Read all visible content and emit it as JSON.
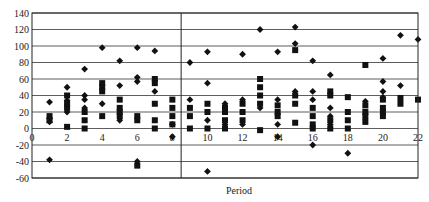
{
  "chart_data": {
    "type": "scatter",
    "title": "",
    "xlabel": "Period",
    "ylabel": "",
    "xlim": [
      0,
      22
    ],
    "ylim": [
      -60,
      140
    ],
    "x_ticks": [
      0,
      2,
      4,
      6,
      8,
      10,
      12,
      14,
      16,
      18,
      20,
      22
    ],
    "y_ticks": [
      -60,
      -40,
      -20,
      0,
      20,
      40,
      60,
      80,
      100,
      120,
      140
    ],
    "grid": {
      "horizontal": true,
      "vertical": false
    },
    "reference_line_x": 8.5,
    "legend": null,
    "series": [
      {
        "name": "diamond",
        "marker": "diamond",
        "points": [
          [
            1,
            32
          ],
          [
            1,
            12
          ],
          [
            1,
            8
          ],
          [
            1,
            -38
          ],
          [
            2,
            50
          ],
          [
            2,
            34
          ],
          [
            2,
            20
          ],
          [
            3,
            72
          ],
          [
            3,
            40
          ],
          [
            3,
            35
          ],
          [
            3,
            25
          ],
          [
            4,
            98
          ],
          [
            4,
            30
          ],
          [
            5,
            82
          ],
          [
            5,
            52
          ],
          [
            5,
            10
          ],
          [
            6,
            98
          ],
          [
            6,
            62
          ],
          [
            6,
            57
          ],
          [
            6,
            -40
          ],
          [
            7,
            94
          ],
          [
            7,
            45
          ],
          [
            8,
            5
          ],
          [
            8,
            -10
          ],
          [
            9,
            80
          ],
          [
            9,
            35
          ],
          [
            10,
            93
          ],
          [
            10,
            55
          ],
          [
            10,
            10
          ],
          [
            10,
            -52
          ],
          [
            11,
            30
          ],
          [
            11,
            5
          ],
          [
            12,
            90
          ],
          [
            12,
            35
          ],
          [
            12,
            5
          ],
          [
            13,
            120
          ],
          [
            13,
            25
          ],
          [
            14,
            93
          ],
          [
            14,
            35
          ],
          [
            14,
            5
          ],
          [
            14,
            -10
          ],
          [
            15,
            123
          ],
          [
            15,
            103
          ],
          [
            15,
            45
          ],
          [
            16,
            82
          ],
          [
            16,
            45
          ],
          [
            16,
            35
          ],
          [
            16,
            -20
          ],
          [
            17,
            65
          ],
          [
            17,
            25
          ],
          [
            17,
            15
          ],
          [
            17,
            5
          ],
          [
            18,
            -30
          ],
          [
            19,
            33
          ],
          [
            20,
            85
          ],
          [
            20,
            57
          ],
          [
            20,
            45
          ],
          [
            20,
            38
          ],
          [
            21,
            113
          ],
          [
            21,
            52
          ],
          [
            22,
            108
          ]
        ]
      },
      {
        "name": "square",
        "marker": "square",
        "points": [
          [
            1,
            15
          ],
          [
            1,
            10
          ],
          [
            2,
            40
          ],
          [
            2,
            30
          ],
          [
            2,
            25
          ],
          [
            2,
            2
          ],
          [
            3,
            20
          ],
          [
            3,
            10
          ],
          [
            3,
            0
          ],
          [
            4,
            55
          ],
          [
            4,
            50
          ],
          [
            4,
            45
          ],
          [
            4,
            15
          ],
          [
            5,
            35
          ],
          [
            5,
            25
          ],
          [
            5,
            20
          ],
          [
            5,
            15
          ],
          [
            6,
            15
          ],
          [
            6,
            10
          ],
          [
            6,
            -45
          ],
          [
            7,
            60
          ],
          [
            7,
            55
          ],
          [
            7,
            30
          ],
          [
            7,
            10
          ],
          [
            7,
            0
          ],
          [
            8,
            35
          ],
          [
            8,
            25
          ],
          [
            8,
            15
          ],
          [
            8,
            5
          ],
          [
            9,
            25
          ],
          [
            9,
            15
          ],
          [
            9,
            0
          ],
          [
            10,
            30
          ],
          [
            10,
            20
          ],
          [
            10,
            0
          ],
          [
            11,
            25
          ],
          [
            11,
            20
          ],
          [
            11,
            10
          ],
          [
            11,
            0
          ],
          [
            12,
            30
          ],
          [
            12,
            20
          ],
          [
            12,
            10
          ],
          [
            13,
            60
          ],
          [
            13,
            50
          ],
          [
            13,
            40
          ],
          [
            13,
            30
          ],
          [
            13,
            -2
          ],
          [
            14,
            28
          ],
          [
            14,
            20
          ],
          [
            14,
            15
          ],
          [
            15,
            95
          ],
          [
            15,
            40
          ],
          [
            15,
            30
          ],
          [
            15,
            7
          ],
          [
            16,
            25
          ],
          [
            16,
            15
          ],
          [
            16,
            5
          ],
          [
            16,
            0
          ],
          [
            17,
            45
          ],
          [
            17,
            40
          ],
          [
            17,
            10
          ],
          [
            17,
            0
          ],
          [
            18,
            38
          ],
          [
            18,
            20
          ],
          [
            18,
            10
          ],
          [
            18,
            0
          ],
          [
            19,
            77
          ],
          [
            19,
            28
          ],
          [
            19,
            20
          ],
          [
            19,
            15
          ],
          [
            19,
            8
          ],
          [
            20,
            35
          ],
          [
            20,
            25
          ],
          [
            20,
            20
          ],
          [
            20,
            15
          ],
          [
            21,
            37
          ],
          [
            21,
            30
          ],
          [
            22,
            35
          ]
        ]
      }
    ]
  },
  "layout": {
    "plot": {
      "left": 32,
      "right": 418,
      "top": 13,
      "bottom": 178
    },
    "colors": {
      "marker": "#111111",
      "grid": "#333333",
      "text": "#222222",
      "background": "#ffffff"
    }
  }
}
